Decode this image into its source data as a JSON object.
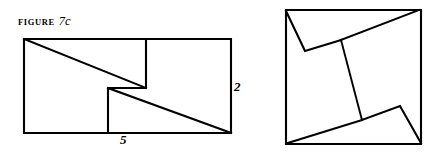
{
  "figure": {
    "caption_prefix": "Figure",
    "caption_number": "7c",
    "stroke_color": "#000000",
    "fill_color": "#ffffff",
    "background": "#ffffff"
  },
  "left_shape": {
    "name": "stepped-rectangle",
    "description": "Rectangle with staircase step cut and two diagonals",
    "dimension_labels": {
      "height": "2",
      "width": "5"
    },
    "outline_points": "24,39 231,39 231,133 24,133",
    "step_path": "M146,39 L146,88 L108,88 L108,133",
    "diagonal_upper": "24,39 146,88",
    "diagonal_lower": "108,88 231,133"
  },
  "right_shape": {
    "name": "dissected-square",
    "description": "Square with pinwheel dissection lines",
    "outline_points": "286,10 421,10 421,144 286,144",
    "cut_upper_left": "286,10 305,51 341,40",
    "cut_upper_diagonal": "341,40 419,10",
    "cut_middle_connector": "341,40 362,120",
    "cut_lower_diagonal": "362,120 288,143",
    "cut_lower_right": "362,120 400,106 421,143"
  }
}
